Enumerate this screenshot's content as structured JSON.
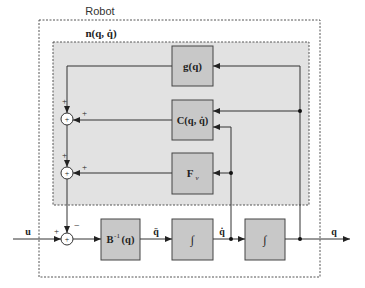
{
  "diagram": {
    "outer_label": "Robot",
    "inner_label": "n(q, q̇)",
    "blocks": {
      "gravity": "g(q)",
      "coriolis": "C(q, q̇)",
      "friction": "F",
      "friction_sub": "v",
      "inverse_inertia": "B",
      "inverse_inertia_sup": "-1",
      "inverse_inertia_arg": "(q)",
      "integrator1": "∫",
      "integrator2": "∫"
    },
    "signals": {
      "input": "u",
      "acceleration": "q̈",
      "velocity": "q̇",
      "output": "q"
    },
    "signs": {
      "sum_top_upper": "+",
      "sum_top_right": "+",
      "sum_mid_upper": "+",
      "sum_mid_right": "+",
      "sum_bottom_left": "+",
      "sum_bottom_upper": "−",
      "sum_symbol": "+"
    },
    "colors": {
      "block_fill": "#c8c8c8",
      "inner_fill": "#e2e2e2",
      "line": "#333333"
    }
  }
}
